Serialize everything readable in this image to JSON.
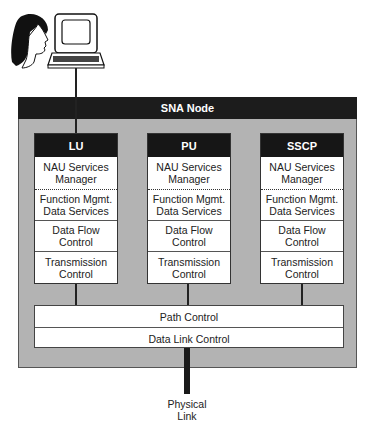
{
  "diagram": {
    "user_terminal": {
      "user_icon": "person-head-icon",
      "terminal_icon": "computer-terminal-icon"
    },
    "node": {
      "title": "SNA Node",
      "columns": [
        {
          "label": "LU",
          "layers": [
            "NAU Services Manager",
            "Function Mgmt. Data Services",
            "Data Flow Control",
            "Transmission Control"
          ]
        },
        {
          "label": "PU",
          "layers": [
            "NAU Services Manager",
            "Function Mgmt. Data Services",
            "Data Flow Control",
            "Transmission Control"
          ]
        },
        {
          "label": "SSCP",
          "layers": [
            "NAU Services Manager",
            "Function Mgmt. Data Services",
            "Data Flow Control",
            "Transmission Control"
          ]
        }
      ],
      "shared_layers": [
        "Path Control",
        "Data Link Control"
      ]
    },
    "physical_link": {
      "label_line1": "Physical",
      "label_line2": "Link"
    },
    "colors": {
      "node_fill": "#b3b3b3",
      "header_fill": "#1c1c1c",
      "box_fill": "#ffffff"
    }
  }
}
